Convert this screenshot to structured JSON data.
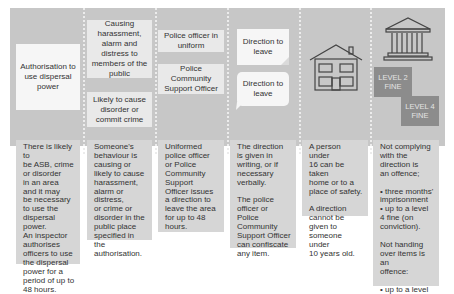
{
  "diagram": {
    "columns": [
      {
        "id": "authorisation",
        "boxes": [
          "Authorisation to use dispersal power"
        ],
        "description": "There is likely to\nbe ASB, crime\nor disorder\nin an area\nand it may\nbe necessary\nto use the\ndispersal power.\nAn inspector\nauthorises\nofficers to use\nthe dispersal\npower for a\nperiod of up to\n48 hours."
      },
      {
        "id": "behaviour",
        "boxes": [
          "Causing harassment, alarm and distress to members of the public",
          "Likely to cause disorder or commit crime"
        ],
        "description": "Someone's\nbehaviour is\ncausing or\nlikely to cause\nharassment,\nalarm or\ndistress,\nor crime or\ndisorder in the\npublic place\nspecified in the\nauthorisation."
      },
      {
        "id": "officer",
        "boxes": [
          "Police officer in uniform",
          "Police Community Support Officer"
        ],
        "description": "Uniformed\npolice officer\nor Police\nCommunity\nSupport\nOfficer issues\na direction to\nleave the area\nfor up to 48\nhours."
      },
      {
        "id": "direction",
        "boxes": [
          "Direction to leave",
          "Direction to leave"
        ],
        "icons": [
          "written-note-icon",
          "speech-bubble-icon"
        ],
        "description": "The direction\nis given in\nwriting, or if\nnecessary\nverbally.\n\nThe police\nofficer or Police\nCommunity\nSupport Officer\ncan confiscate\nany item."
      },
      {
        "id": "under16",
        "icons": [
          "house-icon"
        ],
        "description": "A person under\n16 can be taken\nhome or to a\nplace of safety.\n\nA direction\ncannot be\ngiven to\nsomeone under\n10 years old."
      },
      {
        "id": "offence",
        "icons": [
          "courthouse-icon"
        ],
        "fines": [
          "LEVEL 2\nFINE",
          "LEVEL 4\nFINE"
        ],
        "description": "Not complying\nwith the\ndirection is\nan offence;\n\n• three months'\nimprisonment\n• up to a level\n4 fine (on\nconviction).\n\nNot handing\nover items is an\noffence:\n\n• up to a level\n2 fine\n(on conviction)."
      }
    ],
    "colors": {
      "banner": "#c7c7c7",
      "box": "#e9e9e9",
      "description": "#d6d6d6",
      "fine": "#8c8c8c",
      "icon_stroke": "#444444"
    }
  }
}
